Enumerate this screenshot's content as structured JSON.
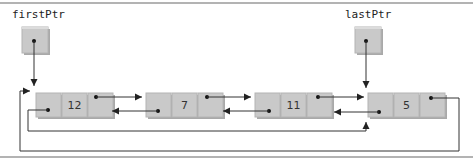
{
  "diagram": {
    "type": "circular doubly-linked list",
    "pointers": [
      {
        "label": "firstPtr",
        "points_to_index": 0
      },
      {
        "label": "lastPtr",
        "points_to_index": 3
      }
    ],
    "nodes": [
      {
        "value": "12"
      },
      {
        "value": "7"
      },
      {
        "value": "11"
      },
      {
        "value": "5"
      }
    ],
    "links": {
      "next": "each node's right cell points to the following node; last node wraps to first",
      "prev": "each node's left cell points to the previous node; first node wraps to last"
    },
    "colors": {
      "node_fill": "#c9c9c9",
      "node_shadow": "#a9a9a9",
      "wire": "#333333",
      "rule": "#9a9a9a"
    }
  }
}
